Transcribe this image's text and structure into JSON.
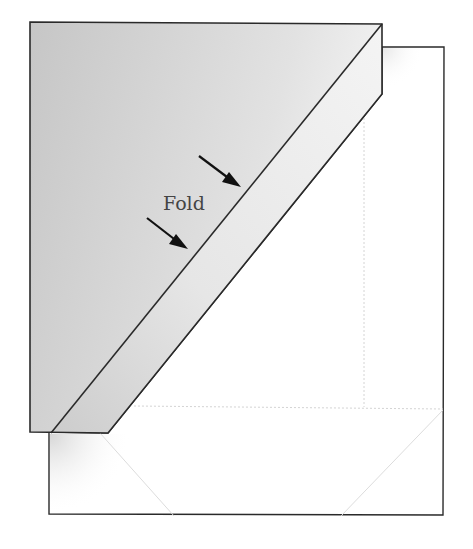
{
  "diagram": {
    "type": "paper-folding-instruction",
    "label": "Fold",
    "colors": {
      "background": "#ffffff",
      "flap_fill_dark": "#c9c9c9",
      "flap_fill_light": "#f0f0f0",
      "outline": "#2a2a2a",
      "crease": "#d8d8d8",
      "arrow": "#111111"
    },
    "arrows": [
      {
        "name": "upper-fold-arrow",
        "from": [
          199,
          156
        ],
        "to": [
          240,
          186
        ]
      },
      {
        "name": "lower-fold-arrow",
        "from": [
          147,
          218
        ],
        "to": [
          187,
          249
        ]
      }
    ]
  }
}
